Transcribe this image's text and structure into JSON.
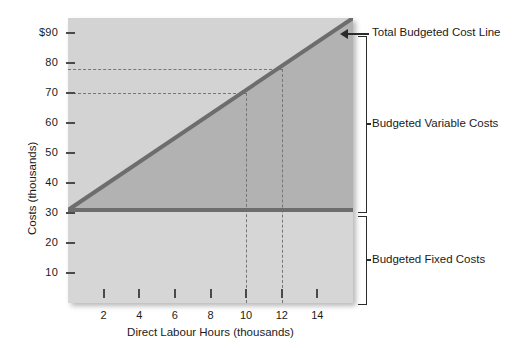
{
  "chart_data": {
    "type": "line",
    "title": "",
    "xlabel": "Direct Labour Hours (thousands)",
    "ylabel": "Costs (thousands)",
    "xlim": [
      0,
      16
    ],
    "ylim": [
      0,
      95
    ],
    "xticks": [
      2,
      4,
      6,
      8,
      10,
      12,
      14
    ],
    "xtick_labels": [
      "2",
      "4",
      "6",
      "8",
      "10",
      "12",
      "14"
    ],
    "yticks": [
      10,
      20,
      30,
      40,
      50,
      60,
      70,
      80,
      90
    ],
    "ytick_labels": [
      "10",
      "20",
      "30",
      "40",
      "50",
      "60",
      "70",
      "80",
      "$90"
    ],
    "grid": false,
    "legend": "none",
    "series": [
      {
        "name": "Total Budgeted Cost Line",
        "type": "line",
        "x": [
          0,
          16
        ],
        "y": [
          31,
          95
        ],
        "color": "#6d6d6d",
        "slope_per_thousand_hours": 4,
        "intercept": 31
      },
      {
        "name": "Budgeted Fixed Costs",
        "type": "line",
        "x": [
          0,
          16
        ],
        "y": [
          31,
          31
        ],
        "color": "#6d6d6d"
      }
    ],
    "areas": [
      {
        "name": "Budgeted Variable Costs",
        "color": "#b2b2b2"
      },
      {
        "name": "Budgeted Fixed Costs",
        "color": "#d6d6d6"
      }
    ],
    "reference_lines": [
      {
        "orientation": "horizontal",
        "y": 70,
        "x_end": 10,
        "style": "dashed"
      },
      {
        "orientation": "horizontal",
        "y": 78,
        "x_end": 12,
        "style": "dashed"
      },
      {
        "orientation": "vertical",
        "x": 10,
        "y_end": 70,
        "style": "dashed"
      },
      {
        "orientation": "vertical",
        "x": 12,
        "y_end": 78,
        "style": "dashed"
      }
    ],
    "annotations": [
      {
        "label": "Total Budgeted Cost Line",
        "marker": "arrow"
      },
      {
        "label": "Budgeted Variable Costs",
        "marker": "bracket"
      },
      {
        "label": "Budgeted Fixed Costs",
        "marker": "bracket"
      }
    ]
  },
  "labels": {
    "y_axis_title": "Costs (thousands)",
    "x_axis_title": "Direct Labour Hours (thousands)",
    "y_ticks": [
      "$90",
      "80",
      "70",
      "60",
      "50",
      "40",
      "30",
      "20",
      "10"
    ],
    "x_ticks": [
      "2",
      "4",
      "6",
      "8",
      "10",
      "12",
      "14"
    ],
    "anno_total": "Total Budgeted Cost Line",
    "anno_variable": "Budgeted Variable Costs",
    "anno_fixed": "Budgeted Fixed Costs"
  }
}
